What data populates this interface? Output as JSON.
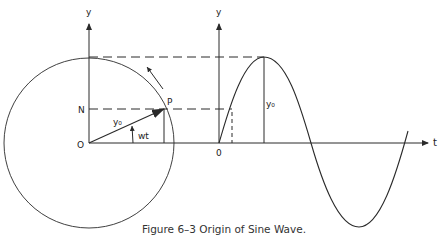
{
  "caption": "Figure 6–3  Origin of Sine Wave.",
  "labels": {
    "circle_y_axis": "y",
    "wave_y_axis": "y",
    "point_n": "N",
    "point_p": "P",
    "origin_circle": "O",
    "origin_wave": "0",
    "radius": "y₀",
    "angle": "wt",
    "amplitude": "y₀",
    "time_axis": "t"
  },
  "colors": {
    "line": "#2a2a2a",
    "background": "#ffffff"
  }
}
